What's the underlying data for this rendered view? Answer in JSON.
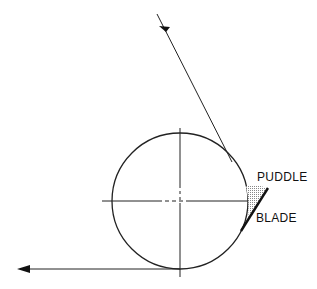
{
  "diagram": {
    "labels": {
      "puddle": "PUDDLE",
      "blade": "BLADE"
    },
    "colors": {
      "line": "#222222",
      "background": "#ffffff",
      "puddle_fill": "#bbbbbb"
    }
  }
}
